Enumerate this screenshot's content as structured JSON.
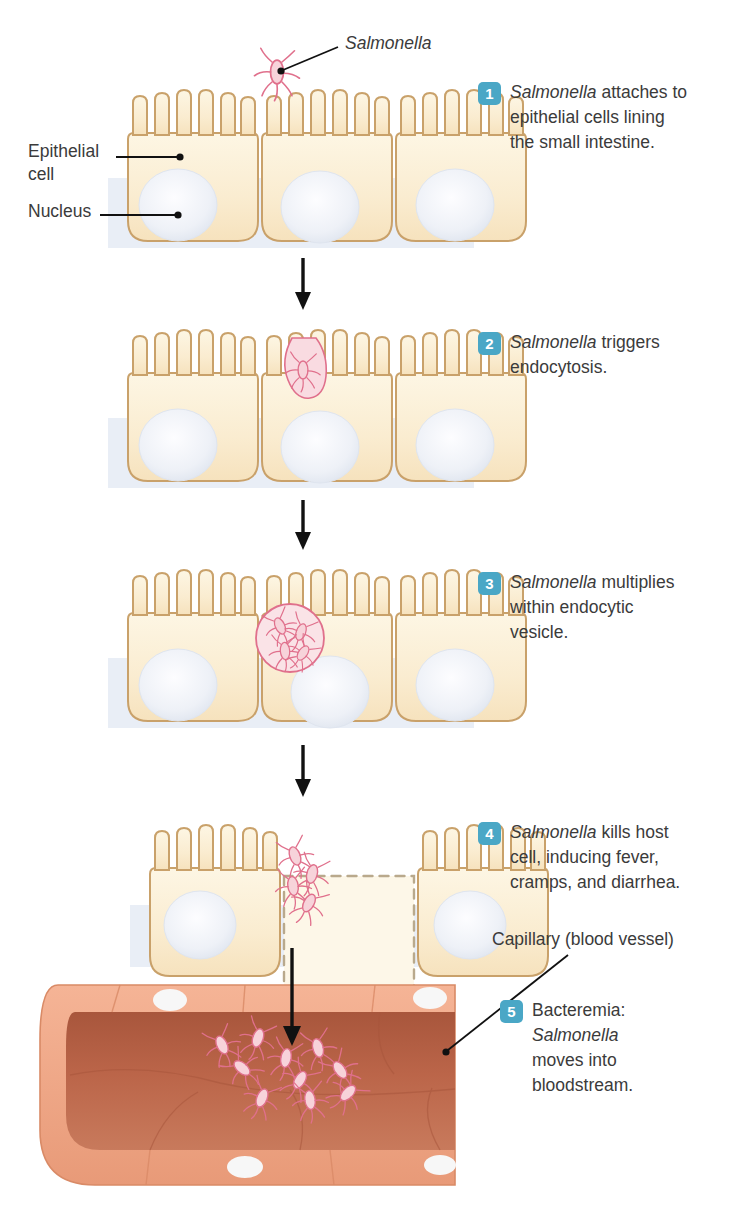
{
  "figure": {
    "background": "#ffffff"
  },
  "colors": {
    "badge": "#4aa7c6",
    "badge_text": "#ffffff",
    "text": "#3b3b3b",
    "cell_fill": "#fbeed2",
    "cell_outline": "#c9a16a",
    "nucleus": "#e7eaf2",
    "bacteria": "#e8879c",
    "bacteria_fill": "#f9dde2",
    "vessel_wall": "#f0a882",
    "vessel_lumen": "#b85f43",
    "band": "#e9eef5",
    "arrow": "#111111",
    "leader": "#111111"
  },
  "labels": [
    {
      "name": "salmonella",
      "text": "Salmonella",
      "italic": true,
      "x": 345,
      "y": 42
    },
    {
      "name": "epithelial-cell",
      "text": "Epithelial\ncell",
      "italic": false,
      "x": 28,
      "y": 140
    },
    {
      "name": "nucleus",
      "text": "Nucleus",
      "italic": false,
      "x": 28,
      "y": 199
    },
    {
      "name": "capillary",
      "text": "Capillary (blood vessel)",
      "italic": false,
      "x": 492,
      "y": 935
    }
  ],
  "steps": [
    {
      "number": "1",
      "lines": [
        "Salmonella",
        " attaches to",
        "epithelial cells lining",
        "the small intestine."
      ],
      "text_plain": "Salmonella attaches to epithelial cells lining the small intestine.",
      "x": 478,
      "y": 80
    },
    {
      "number": "2",
      "lines": [
        "Salmonella",
        " triggers",
        "endocytosis."
      ],
      "text_plain": "Salmonella triggers endocytosis.",
      "x": 478,
      "y": 330
    },
    {
      "number": "3",
      "lines": [
        "Salmonella",
        " multiplies",
        "within endocytic",
        "vesicle."
      ],
      "text_plain": "Salmonella multiplies within endocytic vesicle.",
      "x": 478,
      "y": 570
    },
    {
      "number": "4",
      "lines": [
        "Salmonella",
        " kills host",
        "cell, inducing fever,",
        "cramps, and diarrhea."
      ],
      "text_plain": "Salmonella kills host cell, inducing fever, cramps, and diarrhea.",
      "x": 478,
      "y": 820
    },
    {
      "number": "5",
      "lines": [
        "Bacteremia:",
        "Salmonella",
        "moves into",
        "bloodstream."
      ],
      "text_plain": "Bacteremia: Salmonella moves into bloodstream.",
      "x": 500,
      "y": 998
    }
  ],
  "panels": [
    {
      "name": "panel-1-attachment",
      "y": 70,
      "caption": "Salmonella attached to microvilli of middle cell"
    },
    {
      "name": "panel-2-endocytosis",
      "y": 310,
      "caption": "Bacterium engulfed in membrane invagination"
    },
    {
      "name": "panel-3-multiplication",
      "y": 550,
      "caption": "Bacteria multiplying inside endocytic vesicle"
    },
    {
      "name": "panel-4-cell-death",
      "y": 805,
      "caption": "Middle cell destroyed, dashed outline, bacteria released"
    },
    {
      "name": "panel-5-capillary",
      "y": 975,
      "caption": "Bacteria entering capillary lumen"
    }
  ],
  "arrows": [
    {
      "name": "arrow-1-2",
      "x": 303,
      "y1": 258,
      "y2": 306
    },
    {
      "name": "arrow-2-3",
      "x": 303,
      "y1": 500,
      "y2": 548
    },
    {
      "name": "arrow-3-4",
      "x": 303,
      "y1": 745,
      "y2": 795
    },
    {
      "name": "arrow-4-5",
      "x": 292,
      "y1": 948,
      "y2": 1040
    }
  ]
}
